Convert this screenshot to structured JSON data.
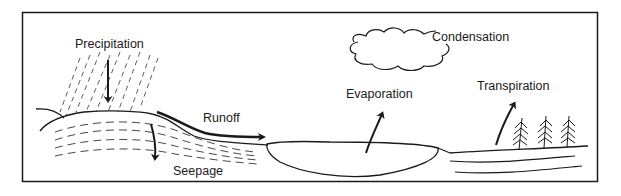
{
  "diagram": {
    "labels": {
      "precipitation": "Precipitation",
      "runoff": "Runoff",
      "seepage": "Seepage",
      "evaporation": "Evaporation",
      "condensation": "Condensation",
      "transpiration": "Transpiration"
    },
    "colors": {
      "ink": "#1a1a1a",
      "background": "#ffffff"
    }
  }
}
